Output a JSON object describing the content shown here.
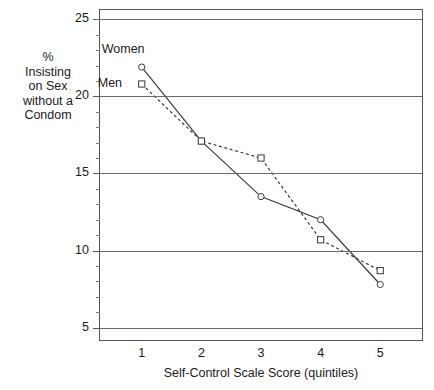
{
  "chart_data": {
    "type": "line",
    "title": "",
    "subtitle": "",
    "xlabel": "Self-Control Scale Score (quintiles)",
    "ylabel": "%\nInsisting\non Sex\nwithout a\nCondom",
    "ylabel_lines": [
      "%",
      "Insisting",
      "on Sex",
      "without a",
      "Condom"
    ],
    "categories": [
      "1",
      "2",
      "3",
      "4",
      "5"
    ],
    "x": [
      1,
      2,
      3,
      4,
      5
    ],
    "xlim": [
      0.3,
      5.7
    ],
    "ylim": [
      4.2,
      25.6
    ],
    "yticks": [
      5,
      10,
      15,
      20,
      25
    ],
    "ytick_labels": [
      "5",
      "10",
      "15",
      "20",
      "25"
    ],
    "yminorticks": [
      6,
      7,
      8,
      9,
      11,
      12,
      13,
      14,
      16,
      17,
      18,
      19,
      21,
      22,
      23,
      24,
      25
    ],
    "grid": "horizontal",
    "legend_position": "inline-annotation",
    "series": [
      {
        "name": "Women",
        "values": [
          21.9,
          17.1,
          13.5,
          12.0,
          7.8
        ],
        "marker": "circle-open",
        "linestyle": "solid",
        "color": "#3a3a3a"
      },
      {
        "name": "Men",
        "values": [
          20.8,
          17.1,
          16.0,
          10.7,
          8.7
        ],
        "marker": "square-open",
        "linestyle": "dashed",
        "color": "#3a3a3a"
      }
    ],
    "annotations": [
      {
        "text": "Women",
        "series": "Women",
        "x": 1,
        "placement": "above-left"
      },
      {
        "text": "Men",
        "series": "Men",
        "x": 1,
        "placement": "left"
      }
    ]
  },
  "colors": {
    "background": "#ffffff",
    "axis": "#555555",
    "gridline": "#6b6b6b",
    "text": "#1a1a1a",
    "series_line": "#3a3a3a"
  }
}
